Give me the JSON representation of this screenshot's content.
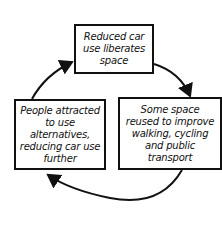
{
  "diagram": {
    "type": "cycle",
    "nodes": [
      {
        "id": "top",
        "label": "Reduced car use liberates space"
      },
      {
        "id": "right",
        "label": "Some space reused to improve walking, cycling and public transport"
      },
      {
        "id": "left",
        "label": "People attracted to use alternatives, reducing car use further"
      }
    ],
    "edges": [
      {
        "from": "top",
        "to": "right"
      },
      {
        "from": "right",
        "to": "left"
      },
      {
        "from": "left",
        "to": "top"
      }
    ],
    "colors": {
      "stroke": "#111111",
      "background": "#ffffff"
    }
  }
}
